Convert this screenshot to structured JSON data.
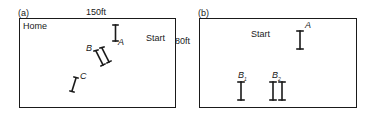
{
  "panels": [
    {
      "id": "a",
      "label": "(a)",
      "width_label": "150ft",
      "height_label": "80ft",
      "places": {
        "home": "Home",
        "start": "Start"
      },
      "markers": [
        {
          "label": "A",
          "type": "single"
        },
        {
          "label": "B",
          "type": "double"
        },
        {
          "label": "C",
          "type": "single"
        }
      ]
    },
    {
      "id": "b",
      "label": "(b)",
      "places": {
        "start": "Start"
      },
      "markers": [
        {
          "label": "A",
          "sub": "",
          "type": "single"
        },
        {
          "label": "B",
          "sub": "1",
          "type": "single"
        },
        {
          "label": "B",
          "sub": "2",
          "type": "double"
        }
      ]
    }
  ]
}
